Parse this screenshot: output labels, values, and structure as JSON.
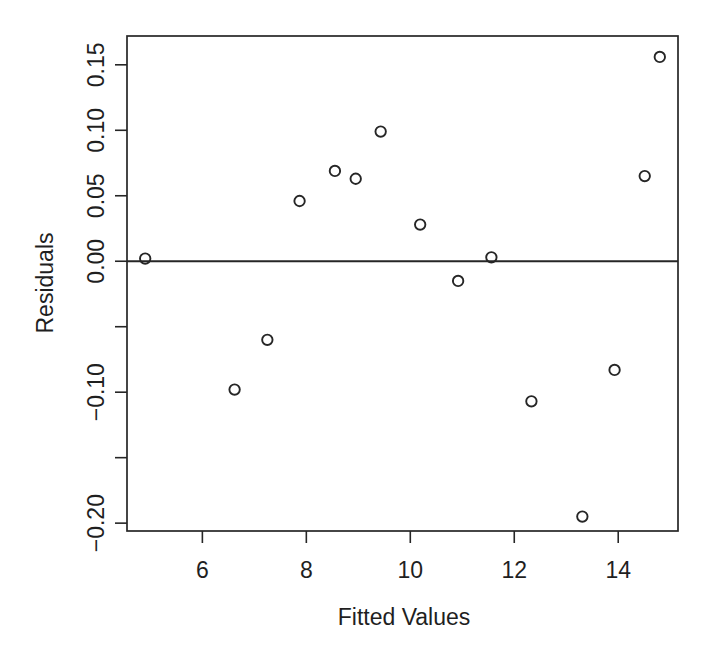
{
  "figure": {
    "background": "#ffffff",
    "ink_color": "#262626",
    "text_color": "#1f1f1f"
  },
  "chart_data": {
    "type": "scatter",
    "title": "",
    "xlabel": "Fitted Values",
    "ylabel": "Residuals",
    "xlim": [
      4.55,
      15.15
    ],
    "ylim": [
      -0.206,
      0.172
    ],
    "grid": false,
    "legend": null,
    "marker": "open-circle",
    "frame": "box",
    "reference_line_y": 0,
    "x_ticks": [
      {
        "v": 6,
        "label": "6"
      },
      {
        "v": 8,
        "label": "8"
      },
      {
        "v": 10,
        "label": "10"
      },
      {
        "v": 12,
        "label": "12"
      },
      {
        "v": 14,
        "label": "14"
      }
    ],
    "y_ticks": [
      {
        "v": 0.15,
        "label": "0.15"
      },
      {
        "v": 0.1,
        "label": "0.10"
      },
      {
        "v": 0.05,
        "label": "0.05"
      },
      {
        "v": 0.0,
        "label": "0.00"
      },
      {
        "v": -0.05,
        "label": ""
      },
      {
        "v": -0.1,
        "label": "−0.10"
      },
      {
        "v": -0.15,
        "label": ""
      },
      {
        "v": -0.2,
        "label": "−0.20"
      }
    ],
    "points": [
      {
        "x": 4.9,
        "y": 0.002
      },
      {
        "x": 6.62,
        "y": -0.098
      },
      {
        "x": 7.25,
        "y": -0.06
      },
      {
        "x": 7.87,
        "y": 0.046
      },
      {
        "x": 8.55,
        "y": 0.069
      },
      {
        "x": 8.95,
        "y": 0.063
      },
      {
        "x": 9.43,
        "y": 0.099
      },
      {
        "x": 10.19,
        "y": 0.028
      },
      {
        "x": 10.92,
        "y": -0.015
      },
      {
        "x": 11.56,
        "y": 0.003
      },
      {
        "x": 12.33,
        "y": -0.107
      },
      {
        "x": 13.31,
        "y": -0.195
      },
      {
        "x": 13.93,
        "y": -0.083
      },
      {
        "x": 14.51,
        "y": 0.065
      },
      {
        "x": 14.8,
        "y": 0.156
      }
    ]
  }
}
